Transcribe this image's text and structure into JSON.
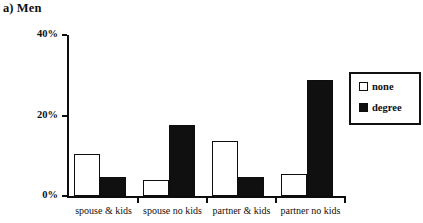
{
  "chart_data": {
    "type": "bar",
    "title": "a) Men",
    "xlabel": "",
    "ylabel": "",
    "ylim": [
      0,
      40
    ],
    "yticks": [
      0,
      20,
      40
    ],
    "ytick_labels": [
      "0%",
      "20%",
      "40%"
    ],
    "grid": false,
    "legend_position": "right",
    "categories": [
      "spouse & kids",
      "spouse no kids",
      "partner & kids",
      "partner no kids"
    ],
    "series": [
      {
        "name": "none",
        "color": "#ffffff",
        "values": [
          10.5,
          4.0,
          13.7,
          5.5
        ]
      },
      {
        "name": "degree",
        "color": "#101010",
        "values": [
          4.7,
          17.6,
          4.7,
          28.8
        ]
      }
    ]
  },
  "legend": {
    "items": [
      {
        "label": "none"
      },
      {
        "label": "degree"
      }
    ]
  },
  "colors": {
    "axis": "#0d0d0d",
    "none_fill": "#ffffff",
    "degree_fill": "#101010",
    "background": "#ffffff"
  }
}
